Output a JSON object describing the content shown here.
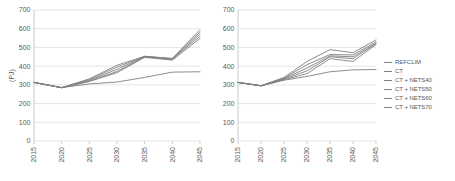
{
  "chart_data": [
    {
      "id": "left",
      "type": "line",
      "title": "",
      "xlabel": "",
      "ylabel": "(PJ)",
      "x": [
        2015,
        2020,
        2025,
        2030,
        2035,
        2040,
        2045
      ],
      "xticklabels": [
        "2015",
        "2020",
        "2025",
        "2030",
        "2035",
        "2040",
        "2045"
      ],
      "ylim": [
        0,
        700
      ],
      "yticks": [
        0,
        100,
        200,
        300,
        400,
        500,
        600,
        700
      ],
      "yticklabels": [
        "0",
        "100",
        "200",
        "300",
        "400",
        "500",
        "600",
        "700"
      ],
      "grid": "horizontal",
      "legend": "right-shared",
      "series": [
        {
          "name": "REFCLIM",
          "color": "#808080",
          "values": [
            313,
            285,
            305,
            315,
            340,
            368,
            370
          ]
        },
        {
          "name": "CT",
          "color": "#808080",
          "values": [
            313,
            285,
            318,
            365,
            447,
            432,
            548
          ]
        },
        {
          "name": "CT + NETS40",
          "color": "#808080",
          "values": [
            313,
            285,
            320,
            372,
            449,
            437,
            560
          ]
        },
        {
          "name": "CT + NETS50",
          "color": "#808080",
          "values": [
            313,
            285,
            324,
            383,
            450,
            438,
            572
          ]
        },
        {
          "name": "CT + NETS60",
          "color": "#808080",
          "values": [
            313,
            285,
            328,
            395,
            452,
            440,
            583
          ]
        },
        {
          "name": "CT + NETS70",
          "color": "#808080",
          "values": [
            313,
            285,
            332,
            405,
            453,
            441,
            595
          ]
        }
      ]
    },
    {
      "id": "right",
      "type": "line",
      "title": "",
      "xlabel": "",
      "ylabel": "",
      "x": [
        2015,
        2020,
        2025,
        2030,
        2035,
        2040,
        2045
      ],
      "xticklabels": [
        "2015",
        "2020",
        "2025",
        "2030",
        "2035",
        "2040",
        "2045"
      ],
      "ylim": [
        0,
        700
      ],
      "yticks": [
        0,
        100,
        200,
        300,
        400,
        500,
        600,
        700
      ],
      "yticklabels": [
        "0",
        "100",
        "200",
        "300",
        "400",
        "500",
        "600",
        "700"
      ],
      "grid": "horizontal",
      "legend": "right-shared",
      "series": [
        {
          "name": "REFCLIM",
          "color": "#808080",
          "values": [
            313,
            295,
            325,
            345,
            370,
            380,
            382
          ]
        },
        {
          "name": "CT",
          "color": "#808080",
          "values": [
            313,
            295,
            327,
            360,
            440,
            425,
            515
          ]
        },
        {
          "name": "CT + NETS40",
          "color": "#808080",
          "values": [
            313,
            295,
            330,
            375,
            450,
            440,
            520
          ]
        },
        {
          "name": "CT + NETS50",
          "color": "#808080",
          "values": [
            313,
            295,
            333,
            390,
            455,
            450,
            523
          ]
        },
        {
          "name": "CT + NETS60",
          "color": "#808080",
          "values": [
            313,
            295,
            336,
            408,
            462,
            460,
            530
          ]
        },
        {
          "name": "CT + NETS70",
          "color": "#808080",
          "values": [
            313,
            295,
            340,
            425,
            488,
            472,
            540
          ]
        }
      ]
    }
  ],
  "legend": {
    "position": "right",
    "items": [
      {
        "label": "REFCLIM",
        "color": "#808080"
      },
      {
        "label": "CT",
        "color": "#808080"
      },
      {
        "label": "CT + NETS40",
        "color": "#808080"
      },
      {
        "label": "CT + NETS50",
        "color": "#808080"
      },
      {
        "label": "CT + NETS60",
        "color": "#808080"
      },
      {
        "label": "CT + NETS70",
        "color": "#808080"
      }
    ]
  },
  "style": {
    "grid_color": "#D9D9D9",
    "axis_color": "#BFBFBF",
    "tick_text_color": "#595959",
    "line_color": "#808080",
    "background": "#FFFFFF"
  }
}
